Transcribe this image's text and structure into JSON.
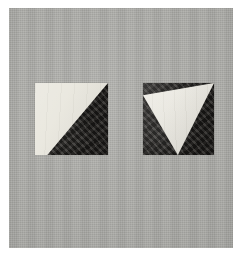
{
  "image": {
    "kind": "photograph",
    "subject": "two-square-paper-specimens",
    "description": "Photograph of two square paper tiles mounted on a gray textured backing board",
    "orientation": "portrait",
    "width_px": 240,
    "height_px": 254
  },
  "canvas": {
    "border_color": "#ffffff",
    "field_color": "#a9a9a5",
    "field_label": "gray-backing-board"
  },
  "specimens": [
    {
      "id": "left",
      "label": "left-square",
      "x": 35,
      "y": 83,
      "width": 73,
      "height": 72,
      "base_color": "#e8e6dd",
      "base_tone": "pale-cream",
      "shape_color": "#272522",
      "shape_tone": "dark-charcoal",
      "shape": "lower-right-triangle",
      "shape_description": "Dark triangular wedge filling the lower-right portion; the diagonal runs from the top-right corner down to the bottom edge at about 17% of the width.",
      "coverage_percent": 42
    },
    {
      "id": "right",
      "label": "right-square",
      "x": 143,
      "y": 83,
      "width": 71,
      "height": 72,
      "base_color": "#2a2825",
      "base_tone": "dark-charcoal",
      "shape_color": "#e9e7de",
      "shape_tone": "pale-cream",
      "shape": "downward-pointing-triangle",
      "shape_description": "Pale triangle spanning the full top edge and tapering to an apex near the bottom-center of the square.",
      "coverage_percent": 48
    }
  ],
  "layout": {
    "specimen_gap_px": 35,
    "specimen_top_px": 83,
    "specimen_bottom_px": 155
  }
}
